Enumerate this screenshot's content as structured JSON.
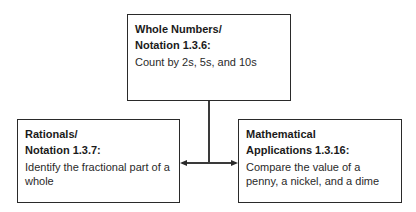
{
  "diagram": {
    "top_box": {
      "title_line1": "Whole Numbers/",
      "title_line2": "Notation 1.3.6:",
      "description": "Count by 2s, 5s, and 10s"
    },
    "left_box": {
      "title_line1": "Rationals/",
      "title_line2": "Notation 1.3.7:",
      "description": "Identify the fractional part of a whole"
    },
    "right_box": {
      "title_line1": "Mathematical",
      "title_line2": "Applications 1.3.16:",
      "description": "Compare the value of a penny, a nickel, and a dime"
    },
    "connectors": [
      {
        "from": "top_box",
        "to": "left_box",
        "type": "arrow"
      },
      {
        "from": "top_box",
        "to": "right_box",
        "type": "arrow"
      }
    ]
  }
}
